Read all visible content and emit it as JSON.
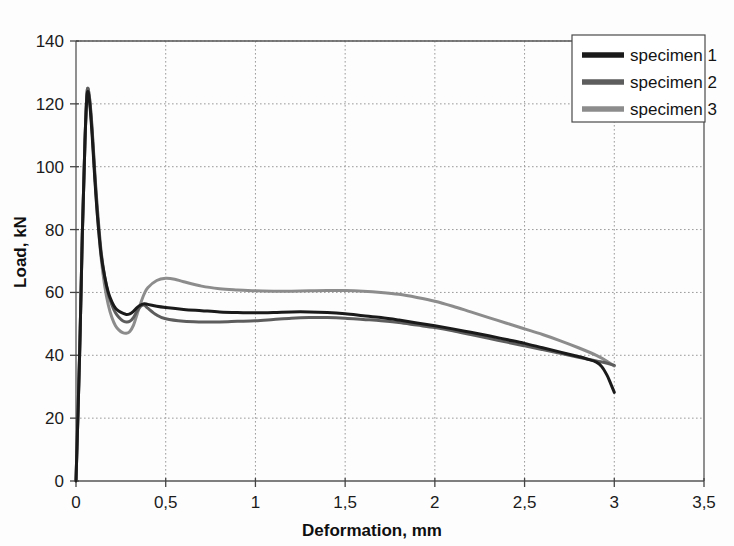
{
  "chart_data": {
    "type": "line",
    "title": "",
    "xlabel": "Deformation, mm",
    "ylabel": "Load, kN",
    "xlim": [
      0,
      3.5
    ],
    "ylim": [
      0,
      140
    ],
    "xticks": [
      "0",
      "0,5",
      "1",
      "1,5",
      "2",
      "2,5",
      "3",
      "3,5"
    ],
    "xtick_values": [
      0,
      0.5,
      1,
      1.5,
      2,
      2.5,
      3,
      3.5
    ],
    "yticks": [
      "0",
      "20",
      "40",
      "60",
      "80",
      "100",
      "120",
      "140"
    ],
    "ytick_values": [
      0,
      20,
      40,
      60,
      80,
      100,
      120,
      140
    ],
    "grid": true,
    "legend_position": "top-right",
    "decimal_separator": ",",
    "series": [
      {
        "name": "specimen 1",
        "color": "#1a1a1a",
        "width": 3.0,
        "x": [
          0,
          0.02,
          0.035,
          0.05,
          0.062,
          0.075,
          0.09,
          0.105,
          0.12,
          0.14,
          0.16,
          0.18,
          0.2,
          0.22,
          0.24,
          0.26,
          0.28,
          0.3,
          0.32,
          0.34,
          0.36,
          0.38,
          0.4,
          0.45,
          0.5,
          0.6,
          0.7,
          0.8,
          0.9,
          1.0,
          1.1,
          1.2,
          1.3,
          1.4,
          1.5,
          1.6,
          1.7,
          1.8,
          1.9,
          2.0,
          2.1,
          2.2,
          2.3,
          2.4,
          2.5,
          2.6,
          2.7,
          2.8,
          2.85,
          2.9,
          2.93,
          2.96,
          2.98,
          3.0
        ],
        "y": [
          0,
          40,
          78,
          108,
          123,
          121,
          110,
          96,
          84,
          72,
          65,
          60,
          57,
          55,
          54,
          53.4,
          53,
          53.2,
          54,
          55.2,
          56,
          56.4,
          56.2,
          55.6,
          55.2,
          54.6,
          54.2,
          53.8,
          53.6,
          53.5,
          53.6,
          53.8,
          53.8,
          53.6,
          53.2,
          52.6,
          52.0,
          51.2,
          50.3,
          49.4,
          48.4,
          47.3,
          46.2,
          45.0,
          43.8,
          42.4,
          41.0,
          39.6,
          38.8,
          37.8,
          36.4,
          33.6,
          31.0,
          28.2
        ]
      },
      {
        "name": "specimen 2",
        "color": "#5d5d5d",
        "width": 3.0,
        "x": [
          0,
          0.02,
          0.035,
          0.05,
          0.062,
          0.075,
          0.09,
          0.105,
          0.12,
          0.14,
          0.16,
          0.18,
          0.2,
          0.22,
          0.24,
          0.26,
          0.28,
          0.3,
          0.32,
          0.34,
          0.36,
          0.38,
          0.4,
          0.45,
          0.5,
          0.6,
          0.7,
          0.8,
          0.9,
          1.0,
          1.1,
          1.2,
          1.3,
          1.4,
          1.5,
          1.6,
          1.7,
          1.8,
          1.9,
          2.0,
          2.1,
          2.2,
          2.3,
          2.4,
          2.5,
          2.6,
          2.7,
          2.8,
          2.9,
          2.95,
          3.0
        ],
        "y": [
          0,
          40,
          78,
          108,
          124,
          122,
          112,
          98,
          86,
          73,
          65,
          59.5,
          56,
          53.5,
          52,
          51,
          50.6,
          50.8,
          52,
          54,
          55.6,
          56,
          55,
          52.8,
          51.6,
          50.8,
          50.6,
          50.6,
          50.8,
          51.0,
          51.4,
          51.8,
          52.0,
          52.0,
          51.8,
          51.4,
          51.0,
          50.4,
          49.6,
          48.8,
          47.8,
          46.6,
          45.4,
          44.2,
          43.0,
          41.8,
          40.6,
          39.4,
          38.2,
          37.6,
          36.8
        ]
      },
      {
        "name": "specimen 3",
        "color": "#8c8c8c",
        "width": 3.0,
        "x": [
          0,
          0.02,
          0.035,
          0.05,
          0.062,
          0.075,
          0.09,
          0.105,
          0.12,
          0.14,
          0.16,
          0.18,
          0.2,
          0.22,
          0.24,
          0.26,
          0.28,
          0.3,
          0.32,
          0.34,
          0.36,
          0.38,
          0.4,
          0.45,
          0.5,
          0.55,
          0.6,
          0.7,
          0.8,
          0.9,
          1.0,
          1.1,
          1.2,
          1.3,
          1.4,
          1.5,
          1.6,
          1.7,
          1.8,
          1.9,
          2.0,
          2.1,
          2.2,
          2.3,
          2.4,
          2.5,
          2.6,
          2.7,
          2.8,
          2.9,
          2.95,
          3.0
        ],
        "y": [
          0,
          40,
          78,
          108,
          124,
          122,
          111,
          97,
          84,
          71,
          62,
          56,
          52,
          49.4,
          48,
          47.2,
          47.0,
          47.6,
          49.5,
          53,
          56.5,
          59.5,
          61.5,
          63.8,
          64.5,
          64.2,
          63.4,
          62.0,
          61.2,
          60.8,
          60.5,
          60.4,
          60.4,
          60.5,
          60.6,
          60.6,
          60.4,
          60.0,
          59.4,
          58.4,
          57.2,
          55.6,
          53.8,
          52.0,
          50.2,
          48.4,
          46.6,
          44.6,
          42.4,
          40.0,
          38.4,
          36.6
        ]
      }
    ]
  },
  "legend": {
    "items": [
      {
        "label": "specimen 1"
      },
      {
        "label": "specimen 2"
      },
      {
        "label": "specimen 3"
      }
    ]
  }
}
